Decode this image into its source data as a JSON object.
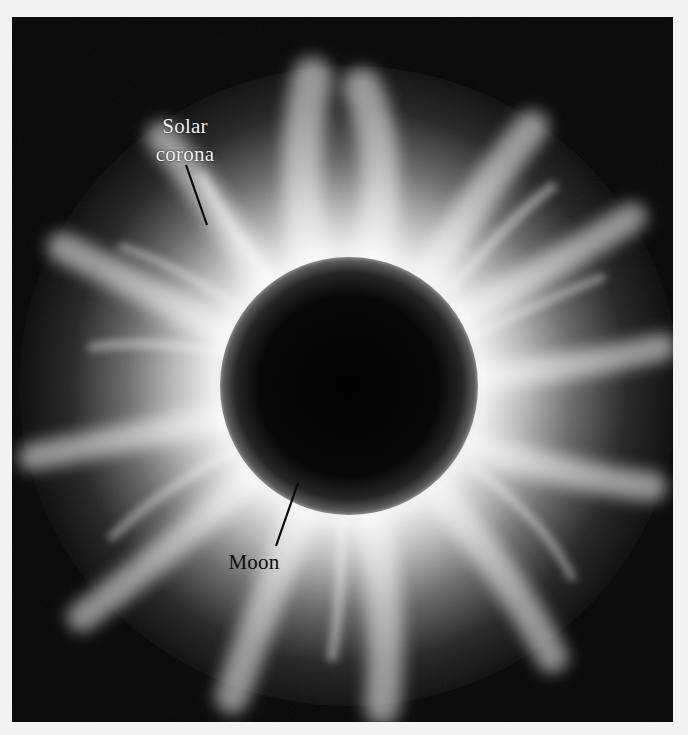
{
  "figure": {
    "colors": {
      "page_background": "#f2f2f2",
      "sky": "#070707",
      "corona": "#f4f4f4",
      "moon": "#060606",
      "label_light": "#f3f3f3",
      "label_dark": "#0c0c0c"
    },
    "labels": {
      "corona_line1": "Solar",
      "corona_line2": "corona",
      "moon": "Moon"
    }
  }
}
